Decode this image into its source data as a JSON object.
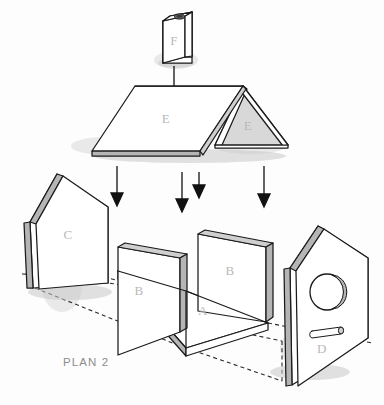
{
  "document": {
    "title": "PLAN 2",
    "type": "exploded-assembly-diagram",
    "subject": "birdhouse"
  },
  "caption": {
    "text": "PLAN 2"
  },
  "parts": [
    {
      "id": "F",
      "label": "F",
      "name": "chimney-block",
      "description": "Small rectangular block with round hole on top face"
    },
    {
      "id": "E1",
      "label": "E",
      "name": "roof-panel-left",
      "description": "Left sloping roof panel"
    },
    {
      "id": "E2",
      "label": "E",
      "name": "roof-panel-right",
      "description": "Right sloping roof panel seen edge-on as triangle"
    },
    {
      "id": "C",
      "label": "C",
      "name": "back-wall-panel",
      "description": "Pentagon gable-shaped back wall"
    },
    {
      "id": "B1",
      "label": "B",
      "name": "side-wall-panel-left",
      "description": "Rectangular left side wall"
    },
    {
      "id": "B2",
      "label": "B",
      "name": "side-wall-panel-right",
      "description": "Rectangular right side wall"
    },
    {
      "id": "A",
      "label": "A",
      "name": "base-floor-panel",
      "description": "Rectangular floor base panel"
    },
    {
      "id": "D",
      "label": "D",
      "name": "front-wall-panel",
      "description": "Pentagon front wall with entrance hole and perch"
    }
  ],
  "features": {
    "entrance_hole": "circular entry hole",
    "perch": "dowel perch below entrance hole",
    "chimney_hole": "oval hole in chimney top"
  },
  "arrows": {
    "count": 5,
    "direction": "down",
    "meaning": "assembly direction"
  },
  "colors": {
    "line": "#1a1a1a",
    "edge_shade": "#b5b5b5",
    "panel_face": "#ffffff",
    "label_text": "#b9b9b9",
    "caption_text": "#8d8d8d",
    "background": "#fdfdfd"
  }
}
